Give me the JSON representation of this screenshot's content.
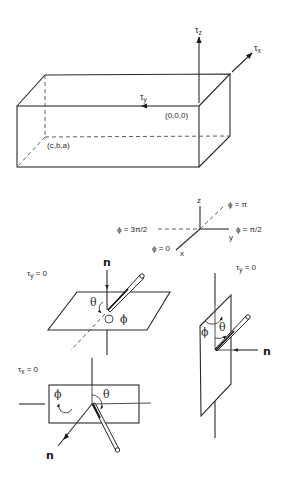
{
  "box_figure": {
    "tau_z": {
      "sym": "τ",
      "sub": "z"
    },
    "tau_x": {
      "sym": "τ",
      "sub": "x"
    },
    "tau_y": {
      "sym": "τ",
      "sub": "y"
    },
    "origin_label": "(0,0,0)",
    "far_corner_label": "(c,b,a)"
  },
  "axes_figure": {
    "z_label": "z",
    "y_label": "y",
    "x_label": "x",
    "phi_pi": "ϕ = π",
    "phi_3pi_2": "ϕ = 3π/2",
    "phi_pi_2": "ϕ = π/2",
    "phi_0": "ϕ = 0"
  },
  "horizontal_plane_figure": {
    "condition": {
      "sym": "τ",
      "sub": "y",
      "rest": " = 0"
    },
    "normal_label": "n",
    "theta_label": "θ",
    "phi_label": "ϕ"
  },
  "vertical_plane_figure": {
    "condition": {
      "sym": "τ",
      "sub": "y",
      "rest": " = 0"
    },
    "normal_label": "n",
    "theta_label": "θ",
    "phi_label": "ϕ"
  },
  "front_plane_figure": {
    "condition": {
      "sym": "τ",
      "sub": "x",
      "rest": " = 0"
    },
    "normal_label": "n",
    "theta_label": "θ",
    "phi_label": "ϕ"
  },
  "colors": {
    "line": "#2a2a2a",
    "background": "#ffffff"
  }
}
